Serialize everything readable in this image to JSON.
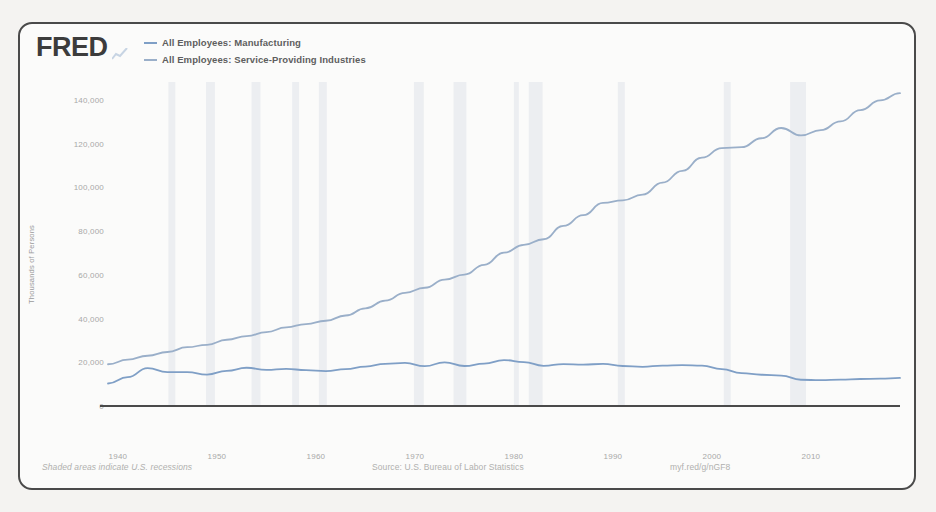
{
  "brand": {
    "logo_text": "FRED",
    "logo_mark_icon": "chart-line-icon"
  },
  "legend": {
    "items": [
      {
        "label": "All Employees: Manufacturing",
        "color": "#7c9cc4"
      },
      {
        "label": "All Employees: Service-Providing Industries",
        "color": "#9aafc9"
      }
    ]
  },
  "footer": {
    "recession_note": "Shaded areas indicate U.S. recessions",
    "source": "Source: U.S. Bureau of Labor Statistics",
    "shortlink": "myf.red/g/nGF8"
  },
  "chart_data": {
    "type": "line",
    "title": "",
    "xlabel": "",
    "ylabel": "Thousands of Persons",
    "xlim": [
      1939,
      2019
    ],
    "ylim": [
      0,
      140000
    ],
    "grid": "vertical-recession-bands",
    "legend_position": "top-left",
    "y_ticks": [
      0,
      20000,
      40000,
      60000,
      80000,
      100000,
      120000,
      140000
    ],
    "y_tick_labels": [
      "0",
      "20,000",
      "40,000",
      "60,000",
      "80,000",
      "100,000",
      "120,000",
      "140,000"
    ],
    "x_ticks": [
      1940,
      1950,
      1960,
      1970,
      1980,
      1990,
      2000,
      2010
    ],
    "x_tick_labels": [
      "1940",
      "1950",
      "1960",
      "1970",
      "1980",
      "1990",
      "2000",
      "2010"
    ],
    "recession_bands": [
      [
        1945.1,
        1945.8
      ],
      [
        1948.9,
        1949.8
      ],
      [
        1953.5,
        1954.4
      ],
      [
        1957.6,
        1958.3
      ],
      [
        1960.3,
        1961.1
      ],
      [
        1969.9,
        1970.9
      ],
      [
        1973.9,
        1975.2
      ],
      [
        1980.0,
        1980.5
      ],
      [
        1981.5,
        1982.9
      ],
      [
        1990.5,
        1991.2
      ],
      [
        2001.2,
        2001.9
      ],
      [
        2007.9,
        2009.5
      ]
    ],
    "series": [
      {
        "name": "All Employees: Manufacturing",
        "color": "#7f9fc6",
        "x": [
          1939,
          1941,
          1943,
          1945,
          1947,
          1949,
          1951,
          1953,
          1955,
          1957,
          1959,
          1961,
          1963,
          1965,
          1967,
          1969,
          1971,
          1973,
          1975,
          1977,
          1979,
          1981,
          1983,
          1985,
          1987,
          1989,
          1991,
          1993,
          1995,
          1997,
          1999,
          2001,
          2003,
          2005,
          2007,
          2009,
          2011,
          2013,
          2015,
          2017,
          2019
        ],
        "values": [
          10300,
          13200,
          17300,
          15500,
          15500,
          14400,
          16100,
          17500,
          16500,
          17000,
          16400,
          16000,
          16900,
          18000,
          19300,
          19700,
          18200,
          20000,
          18300,
          19400,
          21000,
          20100,
          18400,
          19200,
          18900,
          19300,
          18300,
          17900,
          18500,
          18700,
          18500,
          16900,
          15000,
          14300,
          13900,
          12000,
          11800,
          12100,
          12350,
          12500,
          12850
        ]
      },
      {
        "name": "All Employees: Service-Providing Industries",
        "color": "#9aafc9",
        "x": [
          1939,
          1941,
          1943,
          1945,
          1947,
          1949,
          1951,
          1953,
          1955,
          1957,
          1959,
          1961,
          1963,
          1965,
          1967,
          1969,
          1971,
          1973,
          1975,
          1977,
          1979,
          1981,
          1983,
          1985,
          1987,
          1989,
          1991,
          1993,
          1995,
          1997,
          1999,
          2001,
          2003,
          2005,
          2007,
          2009,
          2011,
          2013,
          2015,
          2017,
          2019
        ],
        "values": [
          19100,
          21200,
          23000,
          24700,
          26900,
          28000,
          30300,
          32000,
          33800,
          36000,
          37500,
          39000,
          41400,
          44700,
          48200,
          51800,
          54100,
          57800,
          60100,
          64600,
          70200,
          73700,
          76300,
          82400,
          87300,
          92900,
          94100,
          96700,
          102200,
          107600,
          113600,
          118000,
          118400,
          122500,
          127200,
          123800,
          126200,
          130200,
          135400,
          139800,
          143100
        ]
      }
    ]
  }
}
